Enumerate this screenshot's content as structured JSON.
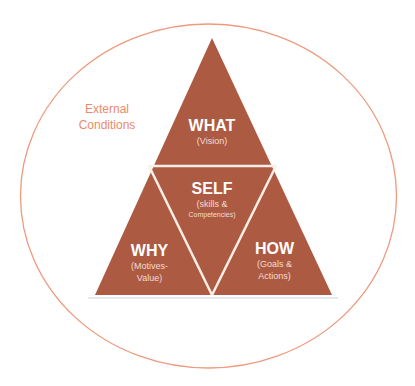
{
  "diagram": {
    "outer_label": "External Conditions",
    "outer_label_lines": [
      "External",
      "Conditions"
    ],
    "colors": {
      "triangle_fill": "#ad5a43",
      "divider": "#fbeee6",
      "ellipse_stroke": "#ee9a7e",
      "outer_text": "#ea8a6a",
      "label_text": "#ffffff"
    },
    "sections": [
      {
        "id": "what",
        "title": "WHAT",
        "subtitle_lines": [
          "(Vision)"
        ]
      },
      {
        "id": "self",
        "title": "SELF",
        "subtitle_lines": [
          "(skills &",
          "Competencies)"
        ]
      },
      {
        "id": "why",
        "title": "WHY",
        "subtitle_lines": [
          "(Motives-",
          "Value)"
        ]
      },
      {
        "id": "how",
        "title": "HOW",
        "subtitle_lines": [
          "(Goals &",
          "Actions)"
        ]
      }
    ]
  }
}
